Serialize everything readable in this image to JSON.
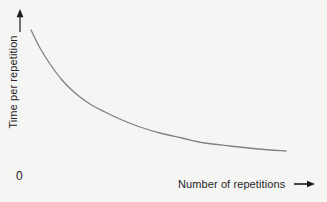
{
  "figure": {
    "background_color": "#f5f5f3",
    "width": 327,
    "height": 202
  },
  "chart_data": {
    "type": "line",
    "title": "",
    "subtitle": "",
    "xlabel": "Number of repetitions",
    "ylabel": "Time per repetition",
    "origin_label": "0",
    "grid": false,
    "legend": null,
    "legend_position": "none",
    "axis_style": "arrow-headed label axes, no drawn axis lines, no tick marks",
    "xlim": [
      0,
      100
    ],
    "ylim": [
      0,
      100
    ],
    "xticks": [],
    "yticks": [],
    "xtick_labels": [],
    "ytick_labels": [],
    "annotations": [],
    "series": [
      {
        "name": "Learning curve",
        "color": "#808080",
        "line_width": 1.3,
        "description": "Decaying exponential: time per repetition falls steeply at first then flattens toward an asymptote",
        "x": [
          0,
          5,
          10,
          15,
          20,
          25,
          30,
          35,
          40,
          45,
          50,
          55,
          60,
          65,
          70,
          75,
          80,
          85,
          90,
          95,
          100
        ],
        "y": [
          100,
          83,
          70,
          60,
          52,
          45,
          40,
          35,
          31,
          28,
          25,
          23,
          21,
          19,
          18,
          17,
          16,
          15,
          14,
          14,
          13
        ]
      }
    ],
    "pixel_path": {
      "comment": "Curve path in figure pixel coordinates (327x202 canvas)",
      "start": [
        31,
        30
      ],
      "end": [
        286,
        151
      ],
      "points": [
        [
          31,
          30
        ],
        [
          40,
          48
        ],
        [
          50,
          64
        ],
        [
          62,
          80
        ],
        [
          75,
          93
        ],
        [
          90,
          104
        ],
        [
          105,
          112
        ],
        [
          122,
          120
        ],
        [
          140,
          127
        ],
        [
          160,
          133
        ],
        [
          182,
          138
        ],
        [
          205,
          143
        ],
        [
          230,
          146
        ],
        [
          258,
          149
        ],
        [
          286,
          151
        ]
      ]
    },
    "colors": {
      "curve": "#808080",
      "text": "#262626",
      "arrow": "#1a1a1a",
      "background": "#f5f5f3"
    }
  },
  "icons": {
    "y_axis_arrow": "arrow-up-icon",
    "x_axis_arrow": "arrow-right-icon"
  }
}
